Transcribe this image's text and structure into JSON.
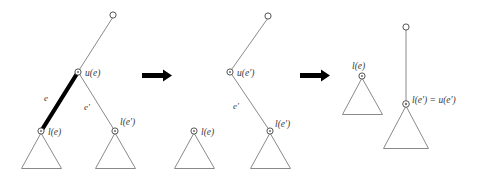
{
  "figure": {
    "background_color": "#ffffff",
    "line_color": "#8a8a8a",
    "highlight_color": "#000000",
    "label_color": "#3a3a3a"
  },
  "panels": [
    {
      "id": "panel-1",
      "name": "before-state",
      "labels": {
        "edge_e": "e",
        "edge_e_prime": "e'",
        "node_upper_e": "u(e)",
        "node_lower_e": "l(e)",
        "node_lower_e_prime": "l(e')"
      }
    },
    {
      "id": "panel-2",
      "name": "after-edge-removal",
      "labels": {
        "edge_e_prime": "e'",
        "node_upper_e_prime": "u(e')",
        "node_lower_e": "l(e)",
        "node_lower_e_prime": "l(e')"
      }
    },
    {
      "id": "panel-3",
      "name": "after-contraction",
      "labels": {
        "node_lower_e": "l(e)",
        "node_merged": "l(e') = u(e')"
      }
    }
  ],
  "arrows": [
    {
      "id": "arrow-1",
      "name": "transition-arrow-one",
      "glyph": "right-arrow"
    },
    {
      "id": "arrow-2",
      "name": "transition-arrow-two",
      "glyph": "right-arrow"
    }
  ]
}
